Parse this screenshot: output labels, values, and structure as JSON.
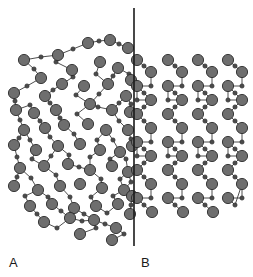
{
  "figure": {
    "background_color": "#ffffff",
    "width": 253,
    "height": 277
  },
  "labels": {
    "left": "A",
    "right": "B"
  },
  "divider": {
    "name": "vertical-divider-line",
    "x": 134,
    "y1": 8,
    "y2": 246,
    "color": "#1a1a1a",
    "width": 1.6
  },
  "style": {
    "large_atom_fill": "#6e6e6e",
    "large_atom_stroke": "#2b2b2b",
    "large_atom_radius": 5.6,
    "small_atom_fill": "#4a4a4a",
    "small_atom_stroke": "#2b2b2b",
    "small_atom_radius": 2.1,
    "bond_color": "#3a3a3a",
    "bond_width": 0.9
  },
  "chart_data": {
    "type": "scatter",
    "xlabel": "",
    "ylabel": "",
    "xlim": [
      0,
      253
    ],
    "ylim": [
      0,
      277
    ],
    "grid": false,
    "legend": "none",
    "annotations": [
      {
        "text": "A",
        "x": 12,
        "y": 263
      },
      {
        "text": "B",
        "x": 144,
        "y": 263
      }
    ],
    "series": [
      {
        "name": "amorphous-large-atoms",
        "region": "A",
        "marker": "circle-large",
        "points": [
          [
            24,
            60
          ],
          [
            58,
            55
          ],
          [
            88,
            43
          ],
          [
            110,
            40
          ],
          [
            128,
            48
          ],
          [
            41,
            78
          ],
          [
            72,
            70
          ],
          [
            100,
            62
          ],
          [
            118,
            68
          ],
          [
            131,
            80
          ],
          [
            14,
            93
          ],
          [
            45,
            96
          ],
          [
            62,
            84
          ],
          [
            84,
            86
          ],
          [
            108,
            84
          ],
          [
            126,
            96
          ],
          [
            16,
            110
          ],
          [
            34,
            113
          ],
          [
            56,
            110
          ],
          [
            90,
            104
          ],
          [
            112,
            110
          ],
          [
            130,
            112
          ],
          [
            24,
            130
          ],
          [
            45,
            128
          ],
          [
            64,
            125
          ],
          [
            88,
            124
          ],
          [
            106,
            130
          ],
          [
            128,
            130
          ],
          [
            14,
            145
          ],
          [
            36,
            150
          ],
          [
            58,
            146
          ],
          [
            80,
            144
          ],
          [
            100,
            150
          ],
          [
            120,
            152
          ],
          [
            132,
            146
          ],
          [
            20,
            168
          ],
          [
            44,
            166
          ],
          [
            68,
            164
          ],
          [
            90,
            170
          ],
          [
            112,
            166
          ],
          [
            128,
            172
          ],
          [
            14,
            186
          ],
          [
            38,
            190
          ],
          [
            60,
            186
          ],
          [
            80,
            184
          ],
          [
            102,
            188
          ],
          [
            124,
            190
          ],
          [
            30,
            206
          ],
          [
            52,
            204
          ],
          [
            74,
            208
          ],
          [
            96,
            206
          ],
          [
            118,
            204
          ],
          [
            132,
            196
          ],
          [
            44,
            222
          ],
          [
            70,
            218
          ],
          [
            94,
            220
          ],
          [
            116,
            228
          ],
          [
            130,
            214
          ],
          [
            80,
            234
          ],
          [
            112,
            240
          ]
        ]
      },
      {
        "name": "amorphous-small-atoms",
        "region": "A",
        "marker": "circle-small",
        "points": [
          [
            41,
            57
          ],
          [
            73,
            49
          ],
          [
            99,
            41
          ],
          [
            119,
            44
          ],
          [
            34,
            69
          ],
          [
            56,
            62
          ],
          [
            27,
            86
          ],
          [
            53,
            90
          ],
          [
            73,
            77
          ],
          [
            96,
            74
          ],
          [
            113,
            76
          ],
          [
            129,
            74
          ],
          [
            15,
            101
          ],
          [
            30,
            105
          ],
          [
            50,
            103
          ],
          [
            76,
            95
          ],
          [
            99,
            94
          ],
          [
            119,
            103
          ],
          [
            131,
            104
          ],
          [
            20,
            120
          ],
          [
            40,
            121
          ],
          [
            60,
            118
          ],
          [
            77,
            114
          ],
          [
            98,
            107
          ],
          [
            119,
            121
          ],
          [
            19,
            138
          ],
          [
            30,
            140
          ],
          [
            50,
            137
          ],
          [
            74,
            134
          ],
          [
            97,
            140
          ],
          [
            113,
            140
          ],
          [
            131,
            139
          ],
          [
            17,
            157
          ],
          [
            32,
            159
          ],
          [
            51,
            156
          ],
          [
            69,
            155
          ],
          [
            90,
            157
          ],
          [
            110,
            159
          ],
          [
            126,
            159
          ],
          [
            17,
            177
          ],
          [
            31,
            178
          ],
          [
            56,
            175
          ],
          [
            79,
            167
          ],
          [
            101,
            179
          ],
          [
            120,
            179
          ],
          [
            25,
            196
          ],
          [
            48,
            197
          ],
          [
            70,
            197
          ],
          [
            91,
            197
          ],
          [
            113,
            196
          ],
          [
            131,
            182
          ],
          [
            37,
            214
          ],
          [
            61,
            211
          ],
          [
            84,
            214
          ],
          [
            107,
            213
          ],
          [
            131,
            205
          ],
          [
            57,
            228
          ],
          [
            82,
            221
          ],
          [
            105,
            224
          ],
          [
            124,
            234
          ],
          [
            96,
            228
          ]
        ]
      },
      {
        "name": "crystalline-large-atoms",
        "region": "B",
        "marker": "circle-large",
        "points": [
          [
            137,
            60
          ],
          [
            168,
            60
          ],
          [
            198,
            60
          ],
          [
            228,
            60
          ],
          [
            151,
            72
          ],
          [
            182,
            72
          ],
          [
            212,
            72
          ],
          [
            242,
            72
          ],
          [
            137,
            86
          ],
          [
            168,
            86
          ],
          [
            198,
            86
          ],
          [
            228,
            86
          ],
          [
            151,
            100
          ],
          [
            182,
            100
          ],
          [
            212,
            100
          ],
          [
            242,
            100
          ],
          [
            137,
            114
          ],
          [
            168,
            114
          ],
          [
            198,
            114
          ],
          [
            228,
            114
          ],
          [
            151,
            128
          ],
          [
            182,
            128
          ],
          [
            212,
            128
          ],
          [
            242,
            128
          ],
          [
            137,
            142
          ],
          [
            168,
            142
          ],
          [
            198,
            142
          ],
          [
            228,
            142
          ],
          [
            151,
            156
          ],
          [
            182,
            156
          ],
          [
            212,
            156
          ],
          [
            242,
            156
          ],
          [
            137,
            170
          ],
          [
            168,
            170
          ],
          [
            198,
            170
          ],
          [
            228,
            170
          ],
          [
            151,
            184
          ],
          [
            182,
            184
          ],
          [
            212,
            184
          ],
          [
            242,
            184
          ],
          [
            137,
            198
          ],
          [
            168,
            198
          ],
          [
            198,
            198
          ],
          [
            228,
            198
          ],
          [
            152,
            212
          ],
          [
            183,
            212
          ],
          [
            213,
            212
          ]
        ]
      },
      {
        "name": "crystalline-small-atoms",
        "region": "B",
        "marker": "circle-small",
        "points": [
          [
            144,
            66
          ],
          [
            175,
            66
          ],
          [
            205,
            66
          ],
          [
            235,
            66
          ],
          [
            151,
            86
          ],
          [
            182,
            86
          ],
          [
            212,
            86
          ],
          [
            242,
            86
          ],
          [
            144,
            93
          ],
          [
            175,
            93
          ],
          [
            205,
            93
          ],
          [
            235,
            93
          ],
          [
            144,
            107
          ],
          [
            175,
            107
          ],
          [
            205,
            107
          ],
          [
            235,
            107
          ],
          [
            137,
            100
          ],
          [
            168,
            100
          ],
          [
            198,
            100
          ],
          [
            228,
            100
          ],
          [
            144,
            121
          ],
          [
            175,
            121
          ],
          [
            205,
            121
          ],
          [
            235,
            121
          ],
          [
            151,
            142
          ],
          [
            182,
            142
          ],
          [
            212,
            142
          ],
          [
            242,
            142
          ],
          [
            144,
            149
          ],
          [
            175,
            149
          ],
          [
            205,
            149
          ],
          [
            235,
            149
          ],
          [
            144,
            163
          ],
          [
            175,
            163
          ],
          [
            205,
            163
          ],
          [
            235,
            163
          ],
          [
            137,
            156
          ],
          [
            168,
            156
          ],
          [
            198,
            156
          ],
          [
            228,
            156
          ],
          [
            144,
            177
          ],
          [
            175,
            177
          ],
          [
            205,
            177
          ],
          [
            235,
            177
          ],
          [
            151,
            198
          ],
          [
            182,
            198
          ],
          [
            212,
            198
          ],
          [
            242,
            198
          ],
          [
            144,
            205
          ],
          [
            175,
            205
          ],
          [
            205,
            205
          ],
          [
            235,
            205
          ]
        ]
      }
    ]
  }
}
